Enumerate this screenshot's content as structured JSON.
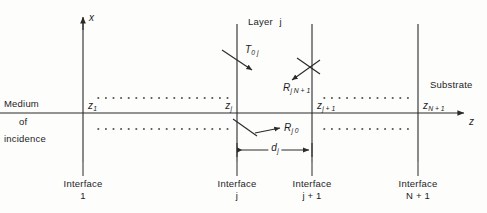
{
  "figure": {
    "type": "optics-multilayer-schematic",
    "background": "#fdfdfc",
    "ink": "#2a2a2a",
    "axes": {
      "x_axis_label": "x",
      "z_axis_label": "z"
    },
    "regions": {
      "left_line1": "Medium",
      "left_line2": "of",
      "left_line3": "incidence",
      "layer_label": "Layer",
      "layer_index": "j",
      "substrate": "Substrate"
    },
    "coordinate_labels": {
      "z1": {
        "base": "z",
        "sub": "1"
      },
      "zj": {
        "base": "z",
        "sub": "j"
      },
      "zj1": {
        "base": "z",
        "sub": "j + 1"
      },
      "zN1": {
        "base": "z",
        "sub": "N + 1"
      }
    },
    "field_labels": {
      "transmitted": {
        "base": "T",
        "sub": "0 j"
      },
      "reflected_forward": {
        "base": "R",
        "sub": "j N + 1"
      },
      "reflected_back": {
        "base": "R",
        "sub": "j 0"
      }
    },
    "thickness": {
      "base": "d",
      "sub": "j"
    },
    "interfaces": [
      {
        "word": "Interface",
        "index": "1"
      },
      {
        "word": "Interface",
        "index": "j"
      },
      {
        "word": "Interface",
        "index": "j + 1"
      },
      {
        "word": "Interface",
        "index": "N + 1"
      }
    ]
  }
}
